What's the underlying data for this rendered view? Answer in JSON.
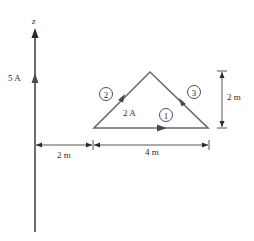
{
  "diagram": {
    "axis": {
      "label": "z"
    },
    "wire": {
      "current_label": "5 A",
      "color": "#6b6b6b"
    },
    "loop": {
      "current_label": "2 A",
      "segments": [
        {
          "id": "1",
          "label": "1"
        },
        {
          "id": "2",
          "label": "2"
        },
        {
          "id": "3",
          "label": "3"
        }
      ],
      "color": "#6b6b6b"
    },
    "dimensions": {
      "height": "2 m",
      "wire_to_loop": "2 m",
      "base": "4 m"
    }
  }
}
